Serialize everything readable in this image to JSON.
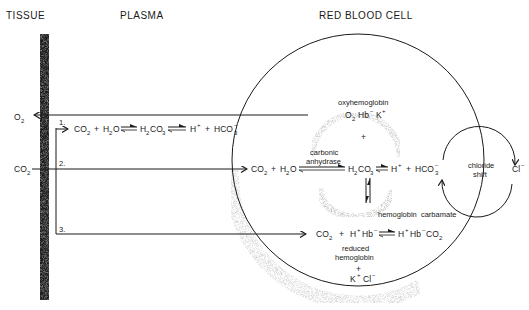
{
  "headers": {
    "tissue": "TISSUE",
    "plasma": "PLASMA",
    "rbc": "RED BLOOD CELL"
  },
  "left_labels": {
    "o2": "O",
    "o2_sub": "2",
    "co2": "CO",
    "co2_sub": "2"
  },
  "pathways": {
    "p1": "1.",
    "p2": "2.",
    "p3": "3."
  },
  "plasma_reaction": {
    "co2": "CO",
    "co2_sub": "2",
    "plus1": "+",
    "h2o_h": "H",
    "h2o_sub": "2",
    "h2o_o": "O",
    "h2co3_h": "H",
    "h2co3_sub1": "2",
    "h2co3_co": "CO",
    "h2co3_sub2": "3",
    "h": "H",
    "h_sup": "+",
    "plus2": "+",
    "hco3": "HCO",
    "hco3_sup": "−",
    "hco3_sub": "3"
  },
  "rbc": {
    "oxyhemoglobin_label": "oxyhemoglobin",
    "o2hb": "O",
    "o2hb_sub": "2",
    "hb": "Hb",
    "hb_sup": "−",
    "k": "K",
    "k_sup": "+",
    "plus_top": "+",
    "carbonic": "carbonic",
    "anhydrase": "anhydrase",
    "co2": "CO",
    "co2_sub": "2",
    "plus1": "+",
    "h2o_h": "H",
    "h2o_sub": "2",
    "h2o_o": "O",
    "h2co3_h": "H",
    "h2co3_sub1": "2",
    "h2co3_co": "CO",
    "h2co3_sub2": "3",
    "h": "H",
    "h_sup": "+",
    "plus2": "+",
    "hco3": "HCO",
    "hco3_sup": "−",
    "hco3_sub": "3",
    "chloride": "chloride",
    "shift": "shift",
    "cl": "Cl",
    "cl_sup": "−",
    "hemoglobin_carbamate": "hemoglobin  carbamate",
    "r3_co2": "CO",
    "r3_co2_sub": "2",
    "r3_plus": "+",
    "r3_h": "H",
    "r3_h_sup": "+",
    "r3_hb": "Hb",
    "r3_hb_sup": "−",
    "r3_prod_h": "H",
    "r3_prod_h_sup": "+",
    "r3_prod_hb": "Hb",
    "r3_prod_hb_sup": "−",
    "r3_prod_co2": "CO",
    "r3_prod_co2_sub": "2",
    "reduced": "reduced",
    "hemoglobin": "hemoglobin",
    "plus_bottom": "+",
    "kcl_k": "K",
    "kcl_k_sup": "+",
    "kcl_cl": "Cl",
    "kcl_cl_sup": "−"
  }
}
